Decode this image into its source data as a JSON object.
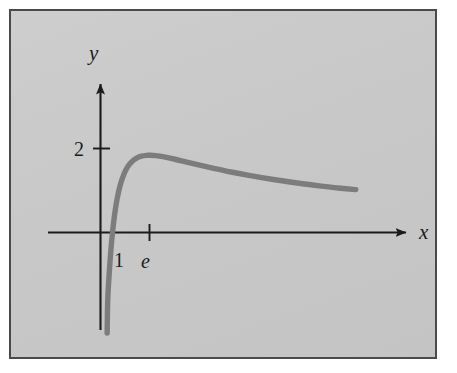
{
  "figure": {
    "kind": "cartesian-plot",
    "background_color": "#c8c8c8",
    "frame_color": "#4a4a4a",
    "axis_color": "#1b1b1b",
    "curve_color": "#7c7c7c"
  },
  "axes": {
    "x_axis_label": "x",
    "y_axis_label": "y",
    "x_ticks": [
      {
        "label": "1",
        "value": 1
      },
      {
        "label": "e",
        "value": 2.718
      }
    ],
    "y_ticks": [
      {
        "label": "2",
        "value": 2
      }
    ],
    "x_arrow": "arrow-right",
    "y_arrow": "arrow-up"
  },
  "chart_data": {
    "type": "line",
    "title": "",
    "xlabel": "x",
    "ylabel": "y",
    "xlim": [
      0.35,
      12.5
    ],
    "ylim": [
      -3.2,
      3.1
    ],
    "grid": false,
    "legend": null,
    "series": [
      {
        "name": "y = 5 ln(x) / x",
        "color": "#7c7c7c",
        "x": [
          0.37,
          0.42,
          0.48,
          0.55,
          0.62,
          0.7,
          0.78,
          0.86,
          0.93,
          1.0,
          1.1,
          1.22,
          1.36,
          1.52,
          1.7,
          1.9,
          2.1,
          2.35,
          2.62,
          2.72,
          3.0,
          3.4,
          3.9,
          4.4,
          5.0,
          5.7,
          6.5,
          7.4,
          8.4,
          9.5,
          10.6,
          11.6,
          12.3
        ],
        "y": [
          -13.43,
          -10.32,
          -7.64,
          -5.43,
          -3.85,
          -2.55,
          -1.59,
          -0.88,
          -0.39,
          0.0,
          0.433,
          0.814,
          1.13,
          1.377,
          1.561,
          1.689,
          1.766,
          1.817,
          1.838,
          1.839,
          1.831,
          1.799,
          1.744,
          1.682,
          1.609,
          1.527,
          1.44,
          1.353,
          1.267,
          1.185,
          1.11,
          1.054,
          1.021
        ],
        "crosses_x_axis_at": 1,
        "maximum": {
          "x": 2.718,
          "y": 1.84
        },
        "behavior": "rises steeply from -infinity near x=0, crosses zero at x=1, peaks just below y=2 near x=e, then decays slowly toward 0"
      }
    ],
    "annotations": []
  }
}
